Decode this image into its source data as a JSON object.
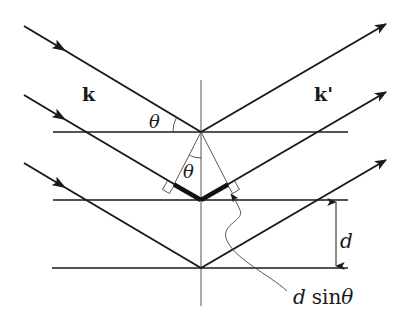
{
  "diagram": {
    "type": "bragg-diffraction",
    "labels": {
      "incident_wavevector": "k",
      "scattered_wavevector": "k'",
      "angle_left": "θ",
      "angle_center": "θ",
      "spacing": "d",
      "path_difference_d": "d",
      "path_difference_sin": "sin",
      "path_difference_theta": "θ"
    },
    "colors": {
      "line": "#1a1a1a",
      "thin_line": "#444444",
      "background": "#ffffff"
    },
    "planes": [
      {
        "y": 132
      },
      {
        "y": 200
      },
      {
        "y": 268
      }
    ],
    "rays": [
      {
        "start": [
          24,
          26
        ],
        "reflect": [
          201,
          132
        ],
        "end": [
          386,
          24
        ]
      },
      {
        "start": [
          24,
          95
        ],
        "reflect": [
          201,
          200
        ],
        "end": [
          386,
          92
        ]
      },
      {
        "start": [
          24,
          163
        ],
        "reflect": [
          201,
          268
        ],
        "end": [
          386,
          160
        ]
      }
    ]
  }
}
